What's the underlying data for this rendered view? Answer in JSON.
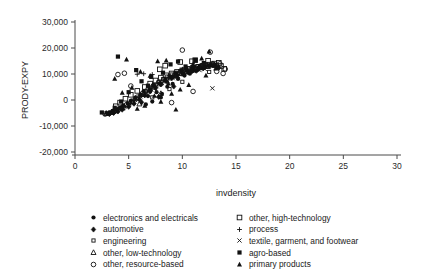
{
  "chart_data": {
    "type": "scatter",
    "title": "",
    "xlabel": "invdensity",
    "ylabel": "PRODY-EXPY",
    "xlim": [
      0,
      30
    ],
    "ylim": [
      -20000,
      30000
    ],
    "xticks": [
      "0",
      "5",
      "10",
      "15",
      "20",
      "25",
      "30"
    ],
    "xtick_values": [
      0,
      5,
      10,
      15,
      20,
      25,
      30
    ],
    "yticks": [
      "30,000",
      "20,000",
      "10,000",
      "0",
      "-10,000",
      "-20,000"
    ],
    "ytick_values": [
      30000,
      20000,
      10000,
      0,
      -10000,
      -20000
    ],
    "grid": false,
    "legend_position": "bottom",
    "series": [
      {
        "name": "electronics and electricals",
        "marker": "filled-circle",
        "points": [
          [
            6.1,
            2100
          ],
          [
            6.4,
            3400
          ],
          [
            6.8,
            1500
          ],
          [
            7.0,
            4200
          ],
          [
            7.3,
            5600
          ],
          [
            7.6,
            3000
          ],
          [
            7.9,
            6400
          ],
          [
            8.1,
            2400
          ],
          [
            8.4,
            7700
          ],
          [
            8.6,
            5100
          ],
          [
            8.9,
            9000
          ],
          [
            9.1,
            6200
          ],
          [
            9.4,
            10300
          ],
          [
            9.6,
            8100
          ],
          [
            9.9,
            11400
          ],
          [
            10.2,
            9400
          ],
          [
            10.4,
            12000
          ],
          [
            10.7,
            10100
          ],
          [
            11.0,
            12600
          ],
          [
            11.3,
            11200
          ],
          [
            11.6,
            13000
          ],
          [
            11.9,
            12100
          ],
          [
            5.6,
            900
          ],
          [
            5.2,
            -300
          ],
          [
            4.9,
            -1200
          ],
          [
            4.5,
            -2100
          ],
          [
            4.2,
            -2900
          ],
          [
            3.8,
            -3600
          ],
          [
            3.5,
            -4200
          ],
          [
            3.2,
            -4800
          ],
          [
            12.2,
            12800
          ],
          [
            12.6,
            13400
          ],
          [
            7.2,
            -600
          ],
          [
            6.6,
            -1700
          ],
          [
            8.0,
            1000
          ]
        ]
      },
      {
        "name": "automotive",
        "marker": "filled-diamond",
        "points": [
          [
            5.0,
            -2600
          ],
          [
            5.5,
            -1400
          ],
          [
            6.0,
            200
          ],
          [
            6.5,
            1800
          ],
          [
            7.0,
            3300
          ],
          [
            7.5,
            4600
          ],
          [
            8.0,
            6000
          ],
          [
            8.5,
            7300
          ],
          [
            9.0,
            8600
          ],
          [
            9.5,
            9600
          ],
          [
            10.0,
            10400
          ],
          [
            10.5,
            11000
          ],
          [
            11.0,
            11600
          ],
          [
            11.5,
            12200
          ],
          [
            12.0,
            12700
          ],
          [
            12.5,
            13100
          ],
          [
            4.4,
            -3700
          ],
          [
            4.0,
            -4400
          ],
          [
            3.6,
            -5000
          ],
          [
            3.2,
            -5400
          ],
          [
            13.0,
            13600
          ],
          [
            13.4,
            12400
          ],
          [
            6.2,
            -900
          ],
          [
            7.8,
            1200
          ],
          [
            9.2,
            5200
          ]
        ]
      },
      {
        "name": "engineering",
        "marker": "small-open-square",
        "points": [
          [
            4.5,
            -3200
          ],
          [
            5.0,
            -2000
          ],
          [
            5.4,
            -800
          ],
          [
            5.8,
            600
          ],
          [
            6.2,
            2000
          ],
          [
            6.6,
            3300
          ],
          [
            7.0,
            4500
          ],
          [
            7.4,
            5700
          ],
          [
            7.8,
            6900
          ],
          [
            8.2,
            8000
          ],
          [
            8.6,
            9000
          ],
          [
            9.0,
            9800
          ],
          [
            9.4,
            10500
          ],
          [
            9.8,
            11100
          ],
          [
            10.2,
            11700
          ],
          [
            10.6,
            12200
          ],
          [
            11.0,
            12600
          ],
          [
            11.4,
            13000
          ],
          [
            11.8,
            13400
          ],
          [
            12.2,
            13700
          ],
          [
            12.8,
            14100
          ],
          [
            13.2,
            13500
          ],
          [
            3.9,
            -4300
          ],
          [
            3.5,
            -4900
          ],
          [
            3.1,
            -5300
          ],
          [
            7.2,
            1000
          ],
          [
            8.8,
            4200
          ],
          [
            10.0,
            7000
          ],
          [
            12.5,
            10800
          ]
        ]
      },
      {
        "name": "other, low-technology",
        "marker": "open-triangle",
        "points": [
          [
            3.4,
            -4700
          ],
          [
            3.9,
            -3900
          ],
          [
            4.4,
            -3000
          ],
          [
            4.9,
            -1900
          ],
          [
            5.4,
            -700
          ],
          [
            5.9,
            700
          ],
          [
            6.4,
            2100
          ],
          [
            6.9,
            3500
          ],
          [
            7.4,
            4900
          ],
          [
            7.9,
            6200
          ],
          [
            8.4,
            7400
          ],
          [
            8.9,
            8500
          ],
          [
            9.4,
            9400
          ],
          [
            9.9,
            10200
          ],
          [
            10.4,
            10900
          ],
          [
            10.9,
            11500
          ],
          [
            11.4,
            12000
          ],
          [
            11.9,
            12500
          ],
          [
            12.4,
            12900
          ],
          [
            13.0,
            13300
          ],
          [
            2.9,
            -5200
          ],
          [
            6.0,
            -1500
          ],
          [
            8.0,
            2500
          ]
        ]
      },
      {
        "name": "other, resource-based",
        "marker": "open-circle",
        "points": [
          [
            3.2,
            -5000
          ],
          [
            3.8,
            -4100
          ],
          [
            4.3,
            -3100
          ],
          [
            4.8,
            -1800
          ],
          [
            5.3,
            -400
          ],
          [
            5.8,
            1100
          ],
          [
            4.0,
            9800
          ],
          [
            4.6,
            10300
          ],
          [
            5.2,
            5400
          ],
          [
            6.3,
            2600
          ],
          [
            6.8,
            4100
          ],
          [
            7.3,
            5500
          ],
          [
            7.8,
            6800
          ],
          [
            8.3,
            7900
          ],
          [
            8.8,
            8900
          ],
          [
            9.3,
            9700
          ],
          [
            9.8,
            10400
          ],
          [
            10.3,
            11000
          ],
          [
            10.8,
            11600
          ],
          [
            11.3,
            12100
          ],
          [
            11.8,
            12600
          ],
          [
            12.3,
            13000
          ],
          [
            12.9,
            13500
          ],
          [
            13.5,
            13900
          ],
          [
            10.0,
            19200
          ],
          [
            12.6,
            18400
          ],
          [
            11.0,
            3300
          ],
          [
            13.8,
            10200
          ],
          [
            14.0,
            11900
          ],
          [
            2.8,
            -5400
          ],
          [
            9.0,
            -1000
          ],
          [
            13.2,
            11000
          ]
        ]
      },
      {
        "name": "other, high-technology",
        "marker": "open-square",
        "points": [
          [
            6.5,
            5000
          ],
          [
            7.0,
            6300
          ],
          [
            7.5,
            7500
          ],
          [
            8.0,
            8600
          ],
          [
            8.5,
            9500
          ],
          [
            9.0,
            10200
          ],
          [
            9.5,
            10800
          ],
          [
            10.0,
            11400
          ],
          [
            10.5,
            11900
          ],
          [
            11.0,
            12400
          ],
          [
            11.5,
            12800
          ],
          [
            12.0,
            13200
          ],
          [
            12.5,
            13600
          ],
          [
            13.0,
            14000
          ],
          [
            13.4,
            14300
          ],
          [
            9.8,
            14600
          ],
          [
            11.2,
            15300
          ],
          [
            12.4,
            15100
          ],
          [
            13.6,
            13100
          ],
          [
            13.9,
            12000
          ],
          [
            5.8,
            3500
          ],
          [
            5.2,
            2000
          ],
          [
            4.7,
            500
          ],
          [
            4.2,
            -1000
          ],
          [
            3.8,
            -2400
          ],
          [
            10.9,
            14900
          ],
          [
            8.4,
            13200
          ],
          [
            7.9,
            11800
          ]
        ]
      },
      {
        "name": "process",
        "marker": "plus",
        "points": [
          [
            4.0,
            -3800
          ],
          [
            4.5,
            -2800
          ],
          [
            5.0,
            -1700
          ],
          [
            5.5,
            -400
          ],
          [
            6.0,
            900
          ],
          [
            6.5,
            2300
          ],
          [
            7.0,
            3700
          ],
          [
            7.5,
            5000
          ],
          [
            8.0,
            6200
          ],
          [
            8.5,
            7300
          ],
          [
            9.0,
            8300
          ],
          [
            9.5,
            9200
          ],
          [
            10.0,
            10000
          ],
          [
            10.5,
            10700
          ],
          [
            11.0,
            11300
          ],
          [
            11.5,
            11900
          ],
          [
            5.8,
            9900
          ],
          [
            6.4,
            10100
          ],
          [
            7.2,
            9800
          ],
          [
            3.5,
            -4600
          ],
          [
            12.0,
            12400
          ]
        ]
      },
      {
        "name": "textile, garment, and footwear",
        "marker": "cross",
        "points": [
          [
            3.6,
            -4500
          ],
          [
            4.1,
            -3500
          ],
          [
            4.6,
            -2500
          ],
          [
            5.1,
            -1300
          ],
          [
            5.6,
            0
          ],
          [
            6.1,
            1400
          ],
          [
            6.6,
            2800
          ],
          [
            7.1,
            4100
          ],
          [
            7.6,
            5300
          ],
          [
            8.1,
            6500
          ],
          [
            8.6,
            7500
          ],
          [
            9.1,
            8400
          ],
          [
            9.6,
            9200
          ],
          [
            10.1,
            9900
          ],
          [
            10.6,
            10500
          ],
          [
            11.1,
            11000
          ],
          [
            11.6,
            11500
          ],
          [
            12.1,
            11900
          ],
          [
            12.8,
            4500
          ],
          [
            3.1,
            -5100
          ]
        ]
      },
      {
        "name": "agro-based",
        "marker": "filled-square",
        "points": [
          [
            2.5,
            -4800
          ],
          [
            4.0,
            16700
          ],
          [
            5.7,
            11500
          ],
          [
            8.9,
            13700
          ],
          [
            9.6,
            14800
          ],
          [
            10.3,
            12900
          ],
          [
            11.2,
            15400
          ],
          [
            12.0,
            14200
          ],
          [
            12.9,
            13300
          ],
          [
            6.2,
            7200
          ],
          [
            7.1,
            8900
          ],
          [
            8.2,
            10500
          ],
          [
            5.0,
            3000
          ],
          [
            4.3,
            -600
          ],
          [
            3.7,
            -3000
          ],
          [
            13.3,
            12600
          ],
          [
            10.8,
            11000
          ],
          [
            9.2,
            9000
          ],
          [
            6.8,
            5500
          ]
        ]
      },
      {
        "name": "primary products",
        "marker": "filled-triangle",
        "points": [
          [
            2.9,
            -4900
          ],
          [
            4.8,
            15600
          ],
          [
            3.7,
            8200
          ],
          [
            5.3,
            4700
          ],
          [
            6.1,
            10900
          ],
          [
            7.0,
            9300
          ],
          [
            7.7,
            14900
          ],
          [
            8.5,
            15200
          ],
          [
            9.0,
            2400
          ],
          [
            9.4,
            -3700
          ],
          [
            8.0,
            -700
          ],
          [
            10.0,
            11800
          ],
          [
            11.0,
            13800
          ],
          [
            11.8,
            16000
          ],
          [
            12.5,
            18700
          ],
          [
            13.1,
            12100
          ],
          [
            6.5,
            -2200
          ],
          [
            5.8,
            -3400
          ],
          [
            7.4,
            1600
          ],
          [
            10.6,
            5800
          ],
          [
            9.8,
            4000
          ],
          [
            4.4,
            2800
          ],
          [
            12.2,
            9400
          ],
          [
            8.7,
            6300
          ]
        ]
      }
    ]
  },
  "legend": {
    "left_column": [
      {
        "marker": "filled-circle",
        "label": "electronics and electricals"
      },
      {
        "marker": "filled-diamond",
        "label": "automotive"
      },
      {
        "marker": "small-open-square",
        "label": "engineering"
      },
      {
        "marker": "open-triangle",
        "label": "other, low-technology"
      },
      {
        "marker": "open-circle",
        "label": "other, resource-based"
      }
    ],
    "right_column": [
      {
        "marker": "open-square",
        "label": "other, high-technology"
      },
      {
        "marker": "plus",
        "label": "process"
      },
      {
        "marker": "cross",
        "label": "textile, garment, and footwear"
      },
      {
        "marker": "filled-square",
        "label": "agro-based"
      },
      {
        "marker": "filled-triangle",
        "label": "primary products"
      }
    ]
  },
  "colors": {
    "marker": "#111111",
    "axis": "#4a4a4a",
    "background": "#ffffff",
    "text": "#1a1a1a"
  }
}
